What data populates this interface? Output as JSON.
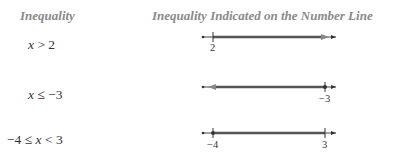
{
  "header": {
    "col1": "Inequality",
    "col2": "Inequality Indicated on the Number Line"
  },
  "rows": [
    {
      "expression": "x > 2",
      "expr_parts": [
        "x",
        " > 2"
      ],
      "number_line": {
        "points": [
          {
            "value": "2",
            "label": "2"
          }
        ],
        "shaded": "from 2 to +infinity",
        "arrow": "right"
      }
    },
    {
      "expression": "x ≤ −3",
      "expr_parts": [
        "x",
        " ≤ −3"
      ],
      "number_line": {
        "points": [
          {
            "value": "-3",
            "label": "−3"
          }
        ],
        "shaded": "from -infinity to -3",
        "arrow": "left"
      }
    },
    {
      "expression": "−4 ≤ x < 3",
      "expr_parts": [
        "−4 ≤ ",
        "x",
        " < 3"
      ],
      "number_line": {
        "points": [
          {
            "value": "-4",
            "label": "−4"
          },
          {
            "value": "3",
            "label": "3"
          }
        ],
        "shaded": "from -4 to 3",
        "arrow": "none"
      }
    }
  ],
  "colors": {
    "header": "#8a8a8a",
    "text": "#333333",
    "line": "#444444",
    "shade": "#555555"
  }
}
